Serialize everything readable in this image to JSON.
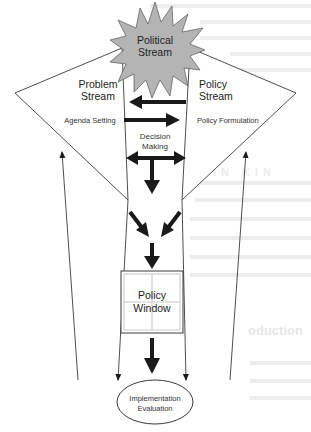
{
  "diagram": {
    "type": "multiple-streams-policy-process",
    "colors": {
      "line": "#3a3a3a",
      "arrow": "#1a1a1a",
      "star_fill": "#b4b4b4",
      "window_grid": "#c8c8c8",
      "bleed_text": "#ececec"
    },
    "nodes": {
      "political_stream": {
        "line1": "Political",
        "line2": "Stream",
        "shape": "starburst"
      },
      "problem_stream": {
        "line1": "Problem",
        "line2": "Stream",
        "sublabel": "Agenda Setting",
        "shape": "triangle"
      },
      "policy_stream": {
        "line1": "Policy",
        "line2": "Stream",
        "sublabel": "Policy Formulation",
        "shape": "triangle"
      },
      "decision_making": {
        "line1": "Decision",
        "line2": "Making"
      },
      "policy_window": {
        "line1": "Policy",
        "line2": "Window",
        "shape": "window-box"
      },
      "implementation": {
        "line1": "Implementation",
        "line2": "Evaluation",
        "shape": "ellipse"
      }
    },
    "edges": [
      {
        "from": "policy_stream",
        "to": "problem_stream",
        "style": "thick"
      },
      {
        "from": "problem_stream",
        "to": "policy_stream",
        "style": "thick"
      },
      {
        "from": "decision_making",
        "to": "both_streams",
        "style": "thick-double"
      },
      {
        "from": "decision_making",
        "to": "convergence",
        "style": "thick"
      },
      {
        "from": "problem_stream",
        "to": "convergence",
        "style": "thick"
      },
      {
        "from": "policy_stream",
        "to": "convergence",
        "style": "thick"
      },
      {
        "from": "convergence",
        "to": "policy_window",
        "style": "thick"
      },
      {
        "from": "policy_window",
        "to": "implementation",
        "style": "thick"
      },
      {
        "from": "implementation",
        "to": "problem_stream",
        "style": "thin-feedback"
      },
      {
        "from": "implementation",
        "to": "policy_stream",
        "style": "thin-feedback"
      },
      {
        "from": "problem_stream",
        "to": "implementation",
        "style": "thin-funnel"
      },
      {
        "from": "policy_stream",
        "to": "implementation",
        "style": "thin-funnel"
      }
    ]
  }
}
